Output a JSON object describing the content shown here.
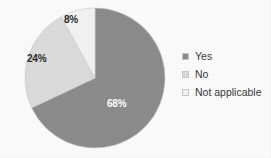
{
  "chart_data": {
    "type": "pie",
    "title": "",
    "subtitle": "",
    "xlabel": "",
    "ylabel": "",
    "grid": false,
    "legend_position": "right",
    "categories": [
      "Yes",
      "No",
      "Not applicable"
    ],
    "values": [
      68,
      24,
      8
    ],
    "unit": "%",
    "data_labels": [
      "68%",
      "24%",
      "8%"
    ],
    "colors": [
      "#8d8d8d",
      "#dddddd",
      "#f4f4f4"
    ],
    "label_colors": [
      "#ffffff",
      "#2b2b2b",
      "#2b2b2b"
    ],
    "slices": [
      {
        "name": "Yes",
        "value": 68,
        "label": "68%",
        "color": "#8d8d8d",
        "start_angle": 0,
        "end_angle": 244.8
      },
      {
        "name": "No",
        "value": 24,
        "label": "24%",
        "color": "#dddddd",
        "start_angle": 244.8,
        "end_angle": 331.2
      },
      {
        "name": "Not applicable",
        "value": 8,
        "label": "8%",
        "color": "#f4f4f4",
        "start_angle": 331.2,
        "end_angle": 360
      }
    ]
  },
  "legend": {
    "items": [
      {
        "label": "Yes",
        "color": "#8d8d8d"
      },
      {
        "label": "No",
        "color": "#dddddd"
      },
      {
        "label": "Not applicable",
        "color": "#f4f4f4"
      }
    ]
  },
  "colors": {
    "background": "#fdfdfd",
    "slice_dark": "#8d8d8d",
    "slice_light": "#dddddd",
    "slice_white": "#f4f4f4",
    "text": "#3a3a3a",
    "label_on_dark": "#ffffff",
    "outline": "#c9c9c9"
  }
}
